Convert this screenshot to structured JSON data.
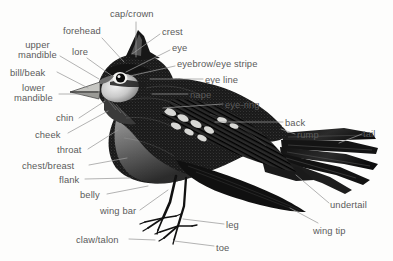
{
  "diagram": {
    "style": "black and white stipple engraving illustration with leader lines",
    "background_color": "#fdfdfc",
    "label_color": "#5b5b5b",
    "leader_color": "#9a9a9a",
    "ink_color": "#1a1a1a"
  },
  "labels": [
    {
      "id": "cap-crown",
      "text": "cap/crown",
      "x": 110,
      "y": 9,
      "align": "left"
    },
    {
      "id": "forehead",
      "text": "forehead",
      "x": 63,
      "y": 26,
      "align": "left"
    },
    {
      "id": "crest",
      "text": "crest",
      "x": 162,
      "y": 27,
      "align": "left"
    },
    {
      "id": "eye",
      "text": "eye",
      "x": 172,
      "y": 43,
      "align": "left"
    },
    {
      "id": "upper-mandible",
      "text": "upper\nmandible",
      "x": 18,
      "y": 40,
      "align": "center"
    },
    {
      "id": "lore",
      "text": "lore",
      "x": 72,
      "y": 47,
      "align": "left"
    },
    {
      "id": "eyebrow-eye-stripe",
      "text": "eyebrow/eye stripe",
      "x": 177,
      "y": 59,
      "align": "left"
    },
    {
      "id": "bill-beak",
      "text": "bill/beak",
      "x": 10,
      "y": 68,
      "align": "left"
    },
    {
      "id": "eye-line",
      "text": "eye line",
      "x": 205,
      "y": 75,
      "align": "left"
    },
    {
      "id": "lower-mandible",
      "text": "lower\nmandible",
      "x": 14,
      "y": 83,
      "align": "center"
    },
    {
      "id": "nape",
      "text": "nape",
      "x": 190,
      "y": 90,
      "align": "left"
    },
    {
      "id": "eye-ring",
      "text": "eye-ring",
      "x": 225,
      "y": 100,
      "align": "left"
    },
    {
      "id": "chin",
      "text": "chin",
      "x": 56,
      "y": 113,
      "align": "left"
    },
    {
      "id": "cheek",
      "text": "cheek",
      "x": 35,
      "y": 130,
      "align": "left"
    },
    {
      "id": "back",
      "text": "back",
      "x": 285,
      "y": 118,
      "align": "left"
    },
    {
      "id": "rump",
      "text": "rump",
      "x": 297,
      "y": 130,
      "align": "left"
    },
    {
      "id": "tail",
      "text": "tail",
      "x": 363,
      "y": 129,
      "align": "left"
    },
    {
      "id": "throat",
      "text": "throat",
      "x": 57,
      "y": 145,
      "align": "left"
    },
    {
      "id": "chest-breast",
      "text": "chest/breast",
      "x": 22,
      "y": 161,
      "align": "left"
    },
    {
      "id": "flank",
      "text": "flank",
      "x": 59,
      "y": 175,
      "align": "left"
    },
    {
      "id": "belly",
      "text": "belly",
      "x": 80,
      "y": 190,
      "align": "left"
    },
    {
      "id": "wing-bar",
      "text": "wing bar",
      "x": 100,
      "y": 206,
      "align": "left"
    },
    {
      "id": "undertail",
      "text": "undertail",
      "x": 330,
      "y": 200,
      "align": "left"
    },
    {
      "id": "leg",
      "text": "leg",
      "x": 226,
      "y": 220,
      "align": "left"
    },
    {
      "id": "wing-tip",
      "text": "wing tip",
      "x": 313,
      "y": 226,
      "align": "left"
    },
    {
      "id": "claw-talon",
      "text": "claw/talon",
      "x": 76,
      "y": 235,
      "align": "left"
    },
    {
      "id": "toe",
      "text": "toe",
      "x": 216,
      "y": 243,
      "align": "left"
    }
  ],
  "leader_lines": [
    {
      "for": "cap-crown",
      "path": "M136,22 L136,57"
    },
    {
      "for": "forehead",
      "path": "M102,38 L124,62"
    },
    {
      "for": "crest",
      "path": "M160,34 L132,54"
    },
    {
      "for": "eye",
      "path": "M170,50 L126,72"
    },
    {
      "for": "upper-mandible",
      "path": "M60,56 L99,79"
    },
    {
      "for": "lore",
      "path": "M87,58 L112,76"
    },
    {
      "for": "eyebrow-eye-stripe",
      "path": "M175,66 L130,76"
    },
    {
      "for": "bill-beak",
      "path": "M57,72 L88,88"
    },
    {
      "for": "eye-line",
      "path": "M203,79 L150,79"
    },
    {
      "for": "lower-mandible",
      "path": "M59,94 L88,94"
    },
    {
      "for": "nape",
      "path": "M188,94 L152,94"
    },
    {
      "for": "eye-ring",
      "path": "M223,104 L163,108"
    },
    {
      "for": "chin",
      "path": "M79,118 L105,101"
    },
    {
      "for": "cheek",
      "path": "M68,133 L108,111"
    },
    {
      "for": "back",
      "path": "M283,122 L215,122"
    },
    {
      "for": "rump",
      "path": "M295,134 L281,129"
    },
    {
      "for": "tail",
      "path": "M362,134 L339,143"
    },
    {
      "for": "throat",
      "path": "M88,149 L118,130"
    },
    {
      "for": "chest-breast",
      "path": "M89,165 L127,158"
    },
    {
      "for": "flank",
      "path": "M85,179 L130,178"
    },
    {
      "for": "belly",
      "path": "M107,194 L148,186"
    },
    {
      "for": "wing-bar",
      "path": "M140,210 L168,190"
    },
    {
      "for": "undertail",
      "path": "M329,203 L296,175"
    },
    {
      "for": "leg",
      "path": "M224,224 L183,219"
    },
    {
      "for": "wing-tip",
      "path": "M318,223 L290,208"
    },
    {
      "for": "claw-talon",
      "path": "M129,239 L155,240"
    },
    {
      "for": "toe",
      "path": "M214,246 L174,241"
    }
  ]
}
